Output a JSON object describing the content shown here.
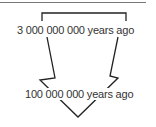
{
  "diagram": {
    "type": "timeline-arrow",
    "labels": {
      "start": "3 000 000 000 years ago",
      "end": "100 000 000 years ago"
    },
    "colors": {
      "stroke": "#222222",
      "text": "#333333",
      "background": "#ffffff"
    }
  }
}
